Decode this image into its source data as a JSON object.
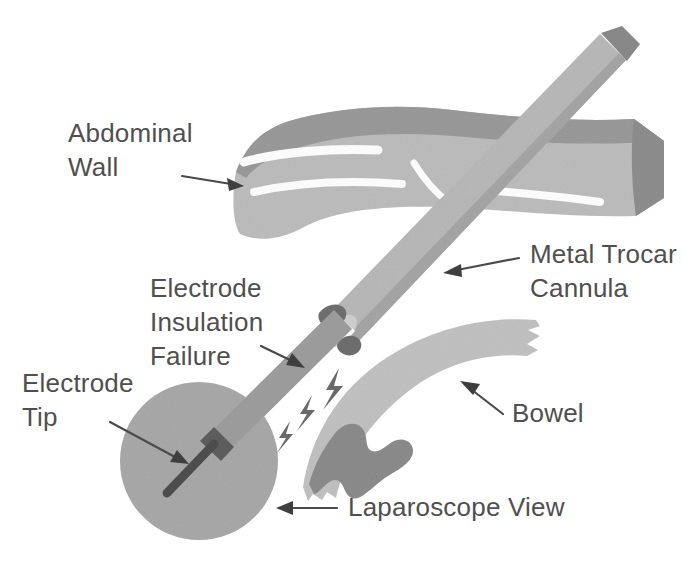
{
  "figure": {
    "background_color": "#ffffff",
    "width": 686,
    "height": 573
  },
  "palette": {
    "wall_top": "#9a9a9a",
    "wall_body": "#bdbdbd",
    "wall_cut_face": "#8e8e8e",
    "wall_striation": "#ffffff",
    "cannula_body": "#b9b9b9",
    "cannula_shade": "#a6a6a6",
    "cannula_cap": "#8a8a8a",
    "electrode_shaft": "#9e9e9e",
    "electrode_insulation_defect": "#6f6f6f",
    "electrode_tip": "#5a5a5a",
    "insulation_break_ring": "#ffffff",
    "laparoscope_circle": "#a9a9a9",
    "bowel_body": "#c2c2c2",
    "bowel_burn": "#8c8c8c",
    "spark": "#6a6a6a",
    "label_text": "#4f4f4f",
    "arrow": "#4a4a4a"
  },
  "labels": [
    {
      "id": "abdominal-wall",
      "lines": [
        "Abdominal",
        "Wall"
      ],
      "x": 68,
      "y": 142,
      "line_height": 34,
      "anchor": "start"
    },
    {
      "id": "metal-trocar-cannula",
      "lines": [
        "Metal Trocar",
        "Cannula"
      ],
      "x": 530,
      "y": 263,
      "line_height": 34,
      "anchor": "start"
    },
    {
      "id": "electrode-insulation-failure",
      "lines": [
        "Electrode",
        "Insulation",
        "Failure"
      ],
      "x": 150,
      "y": 297,
      "line_height": 34,
      "anchor": "start"
    },
    {
      "id": "electrode-tip",
      "lines": [
        "Electrode",
        "Tip"
      ],
      "x": 22,
      "y": 392,
      "line_height": 34,
      "anchor": "start"
    },
    {
      "id": "bowel",
      "lines": [
        "Bowel"
      ],
      "x": 512,
      "y": 422,
      "line_height": 34,
      "anchor": "start"
    },
    {
      "id": "laparoscope-view",
      "lines": [
        "Laparoscope View"
      ],
      "x": 348,
      "y": 516,
      "line_height": 34,
      "anchor": "start"
    }
  ],
  "anatomy": {
    "abdominal_wall_name": "Abdominal Wall",
    "bowel_name": "Bowel",
    "bowel_burn_name": "Thermal burn lesion"
  },
  "instrument": {
    "cannula_name": "Metal Trocar Cannula",
    "electrode_name": "Electrode",
    "electrode_tip_name": "Electrode Tip",
    "insulation_defect_name": "Electrode Insulation Failure",
    "spark_count": 3,
    "laparoscope_view_name": "Laparoscope View"
  }
}
